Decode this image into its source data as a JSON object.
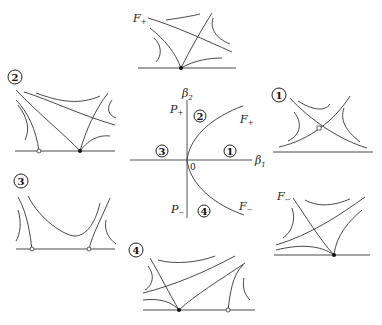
{
  "diagram": {
    "type": "bifurcation-diagram",
    "center": {
      "axes": {
        "horizontal": "β1",
        "vertical": "β2",
        "origin": "0"
      },
      "curves": [
        {
          "name": "F+",
          "label": "F+"
        },
        {
          "name": "F-",
          "label": "F−"
        },
        {
          "name": "P+",
          "label": "P+"
        },
        {
          "name": "P-",
          "label": "P−"
        }
      ],
      "regions": [
        "1",
        "2",
        "3",
        "4"
      ]
    },
    "panels": [
      {
        "id": "F+",
        "label": "F+",
        "position": "top"
      },
      {
        "id": "2",
        "label": "2",
        "position": "upper-left"
      },
      {
        "id": "1",
        "label": "1",
        "position": "upper-right"
      },
      {
        "id": "3",
        "label": "3",
        "position": "lower-left"
      },
      {
        "id": "F-",
        "label": "F−",
        "position": "lower-right"
      },
      {
        "id": "4",
        "label": "4",
        "position": "bottom"
      }
    ]
  },
  "labels": {
    "beta1": "β",
    "beta1_sub": "1",
    "beta2": "β",
    "beta2_sub": "2",
    "origin": "0",
    "Fplus": "F",
    "Fplus_sub": "+",
    "Fminus": "F",
    "Fminus_sub": "−",
    "Pplus": "P",
    "Pplus_sub": "+",
    "Pminus": "P",
    "Pminus_sub": "−",
    "r1": "1",
    "r2": "2",
    "r3": "3",
    "r4": "4"
  }
}
